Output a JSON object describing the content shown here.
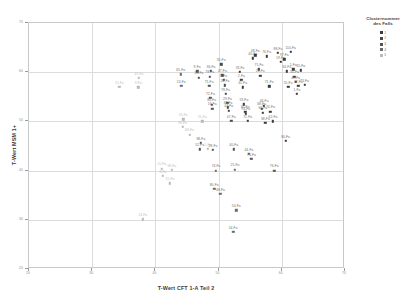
{
  "chart_data": {
    "type": "scatter",
    "title": "",
    "xlabel": "T-Wert CFT 1-A Teil 2",
    "ylabel": "T-Wert MSM 1+",
    "xlim": [
      20,
      70
    ],
    "ylim": [
      20,
      70
    ],
    "xticks": [
      20,
      30,
      40,
      50,
      60,
      70
    ],
    "yticks": [
      20,
      30,
      40,
      50,
      60,
      70
    ],
    "grid": true,
    "legend_position": "right",
    "legend_title_line1": "Clusternummer",
    "legend_title_line2": "des Falls",
    "legend": [
      {
        "name": "1",
        "color": "#3b3b3b"
      },
      {
        "name": "2",
        "color": "#4a4a4a"
      },
      {
        "name": "3",
        "color": "#555555"
      },
      {
        "name": "4",
        "color": "#6b6b6b"
      },
      {
        "name": "5",
        "color": "#b9b9b9"
      }
    ],
    "point_label_suffix": "-Fa",
    "points": [
      {
        "x": 34.3,
        "y": 57.0,
        "label": "12-Fa",
        "cluster": 5
      },
      {
        "x": 37.4,
        "y": 58.8,
        "label": "45-Fa",
        "cluster": 5
      },
      {
        "x": 37.3,
        "y": 56.9,
        "label": "9-Fa",
        "cluster": 5
      },
      {
        "x": 44.0,
        "y": 59.6,
        "label": "65-Fa",
        "cluster": 4
      },
      {
        "x": 44.1,
        "y": 57.2,
        "label": "24-Fa",
        "cluster": 4
      },
      {
        "x": 44.4,
        "y": 50.4,
        "label": "35-Fa",
        "cluster": 5
      },
      {
        "x": 44.3,
        "y": 48.9,
        "label": "90-Fa",
        "cluster": 5
      },
      {
        "x": 45.4,
        "y": 47.3,
        "label": "68-Fa",
        "cluster": 5
      },
      {
        "x": 46.6,
        "y": 60.2,
        "label": "9-Fa",
        "cluster": 3
      },
      {
        "x": 46.9,
        "y": 58.9,
        "label": "20-Fa",
        "cluster": 3
      },
      {
        "x": 47.4,
        "y": 50.0,
        "label": "25-Fa",
        "cluster": 5
      },
      {
        "x": 47.2,
        "y": 45.6,
        "label": "88-Fa",
        "cluster": 3
      },
      {
        "x": 47.0,
        "y": 44.3,
        "label": "52-Fa",
        "cluster": 3
      },
      {
        "x": 48.3,
        "y": 44.4,
        "label": "1-Fa",
        "cluster": 5
      },
      {
        "x": 48.5,
        "y": 57.2,
        "label": "71-Fa",
        "cluster": 3
      },
      {
        "x": 48.6,
        "y": 59.1,
        "label": "78-Fa",
        "cluster": 3
      },
      {
        "x": 48.8,
        "y": 60.3,
        "label": "36-Fa",
        "cluster": 3
      },
      {
        "x": 48.7,
        "y": 54.8,
        "label": "72-Fa",
        "cluster": 3
      },
      {
        "x": 48.9,
        "y": 53.4,
        "label": "80-Fa",
        "cluster": 3
      },
      {
        "x": 49.0,
        "y": 52.6,
        "label": "16-Fa",
        "cluster": 3
      },
      {
        "x": 49.1,
        "y": 44.2,
        "label": "23-Fa",
        "cluster": 3
      },
      {
        "x": 49.6,
        "y": 40.0,
        "label": "74-Fa",
        "cluster": 4
      },
      {
        "x": 49.3,
        "y": 36.3,
        "label": "80-Fa",
        "cluster": 4
      },
      {
        "x": 50.3,
        "y": 35.3,
        "label": "48-Fa",
        "cluster": 4
      },
      {
        "x": 50.4,
        "y": 61.6,
        "label": "35-Fa",
        "cluster": 2
      },
      {
        "x": 50.6,
        "y": 59.4,
        "label": "47-Fa",
        "cluster": 2
      },
      {
        "x": 50.8,
        "y": 58.4,
        "label": "9-Fa",
        "cluster": 2
      },
      {
        "x": 51.0,
        "y": 57.3,
        "label": "26-Fa",
        "cluster": 2
      },
      {
        "x": 51.1,
        "y": 55.6,
        "label": "78-Fa",
        "cluster": 2
      },
      {
        "x": 51.4,
        "y": 53.8,
        "label": "29-Fa",
        "cluster": 2
      },
      {
        "x": 51.5,
        "y": 52.9,
        "label": "63-Fa",
        "cluster": 2
      },
      {
        "x": 51.6,
        "y": 52.2,
        "label": "47-Fa",
        "cluster": 2
      },
      {
        "x": 52.0,
        "y": 50.1,
        "label": "47-Fa",
        "cluster": 2
      },
      {
        "x": 52.4,
        "y": 44.3,
        "label": "40-Fa",
        "cluster": 3
      },
      {
        "x": 52.6,
        "y": 40.2,
        "label": "25-Fa",
        "cluster": 4
      },
      {
        "x": 52.8,
        "y": 31.9,
        "label": "54-Fa",
        "cluster": 4
      },
      {
        "x": 52.3,
        "y": 27.5,
        "label": "54-Fa",
        "cluster": 4
      },
      {
        "x": 53.4,
        "y": 60.1,
        "label": "33-Fa",
        "cluster": 1
      },
      {
        "x": 53.6,
        "y": 58.4,
        "label": "2-Fa",
        "cluster": 1
      },
      {
        "x": 53.8,
        "y": 56.9,
        "label": "41-Fa",
        "cluster": 1
      },
      {
        "x": 54.0,
        "y": 53.5,
        "label": "59-Fa",
        "cluster": 1
      },
      {
        "x": 54.2,
        "y": 52.0,
        "label": "35-Fa",
        "cluster": 1
      },
      {
        "x": 54.3,
        "y": 51.6,
        "label": "94-Fa",
        "cluster": 1
      },
      {
        "x": 54.6,
        "y": 50.1,
        "label": "72-Fa",
        "cluster": 1
      },
      {
        "x": 54.8,
        "y": 43.4,
        "label": "44-Fa",
        "cluster": 3
      },
      {
        "x": 55.2,
        "y": 42.4,
        "label": "73-Fa",
        "cluster": 3
      },
      {
        "x": 55.4,
        "y": 62.8,
        "label": "46-Fa",
        "cluster": 1
      },
      {
        "x": 55.8,
        "y": 63.4,
        "label": "48-Fa",
        "cluster": 1
      },
      {
        "x": 56.4,
        "y": 60.6,
        "label": "75-Fa",
        "cluster": 1
      },
      {
        "x": 56.6,
        "y": 59.3,
        "label": "28-Fa",
        "cluster": 1
      },
      {
        "x": 56.8,
        "y": 52.6,
        "label": "68-Fa",
        "cluster": 1
      },
      {
        "x": 57.0,
        "y": 51.8,
        "label": "66-Fa",
        "cluster": 1
      },
      {
        "x": 57.2,
        "y": 53.2,
        "label": "44-Fa",
        "cluster": 1
      },
      {
        "x": 57.4,
        "y": 49.7,
        "label": "38-Fa",
        "cluster": 1
      },
      {
        "x": 57.6,
        "y": 63.2,
        "label": "76-Fa",
        "cluster": 1
      },
      {
        "x": 58.0,
        "y": 57.1,
        "label": "71-Fa",
        "cluster": 1
      },
      {
        "x": 58.2,
        "y": 52.0,
        "label": "74-Fa",
        "cluster": 1
      },
      {
        "x": 58.6,
        "y": 50.0,
        "label": "62-Fa",
        "cluster": 1
      },
      {
        "x": 58.8,
        "y": 40.0,
        "label": "76-Fa",
        "cluster": 3
      },
      {
        "x": 59.4,
        "y": 63.9,
        "label": "88-Fa",
        "cluster": 1
      },
      {
        "x": 59.8,
        "y": 62.1,
        "label": "19-Fa",
        "cluster": 1
      },
      {
        "x": 60.4,
        "y": 62.6,
        "label": "97-Fa",
        "cluster": 1
      },
      {
        "x": 60.8,
        "y": 60.2,
        "label": "64-Fa",
        "cluster": 1
      },
      {
        "x": 61.0,
        "y": 57.0,
        "label": "55-Fa",
        "cluster": 1
      },
      {
        "x": 61.4,
        "y": 64.1,
        "label": "110-Fa",
        "cluster": 1
      },
      {
        "x": 61.8,
        "y": 60.6,
        "label": "1-Fa",
        "cluster": 1
      },
      {
        "x": 62.0,
        "y": 59.1,
        "label": "35-Fa",
        "cluster": 1
      },
      {
        "x": 62.2,
        "y": 58.0,
        "label": "49-Fa",
        "cluster": 1
      },
      {
        "x": 62.6,
        "y": 57.2,
        "label": "47-Fa",
        "cluster": 1
      },
      {
        "x": 63.0,
        "y": 60.4,
        "label": "35-Fa",
        "cluster": 1
      },
      {
        "x": 63.6,
        "y": 57.4,
        "label": "73-Fa",
        "cluster": 1
      },
      {
        "x": 62.4,
        "y": 55.6,
        "label": "1-Fa",
        "cluster": 1
      },
      {
        "x": 60.6,
        "y": 46.0,
        "label": "80-Fa",
        "cluster": 1
      },
      {
        "x": 41.0,
        "y": 40.4,
        "label": "15-Fa",
        "cluster": 5
      },
      {
        "x": 41.2,
        "y": 38.9,
        "label": "8-Fa",
        "cluster": 5
      },
      {
        "x": 42.3,
        "y": 37.4,
        "label": "21-Fa",
        "cluster": 5
      },
      {
        "x": 42.6,
        "y": 40.1,
        "label": "68-Fa",
        "cluster": 5
      },
      {
        "x": 38.0,
        "y": 30.1,
        "label": "14-Fa",
        "cluster": 5
      }
    ]
  }
}
